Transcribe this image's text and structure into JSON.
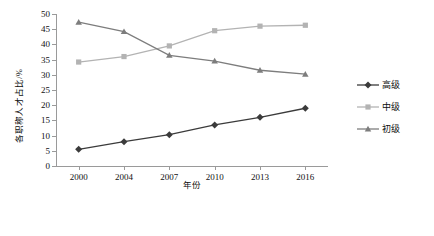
{
  "chart_data": {
    "type": "line",
    "title": "",
    "xlabel": "年份",
    "ylabel": "各职称人才占比/%",
    "categories": [
      "2000",
      "2004",
      "2007",
      "2010",
      "2013",
      "2016"
    ],
    "ylim": [
      0,
      50
    ],
    "ytick_values": [
      0,
      5,
      10,
      15,
      20,
      25,
      30,
      35,
      40,
      45,
      50
    ],
    "ytick_labels": [
      "0",
      "5",
      "10",
      "15",
      "20",
      "25",
      "30",
      "35",
      "40",
      "45",
      "50"
    ],
    "grid": false,
    "legend_position": "right",
    "series": [
      {
        "name": "高级",
        "values": [
          5.5,
          8.0,
          10.3,
          13.5,
          16.0,
          19.0
        ],
        "color": "#3b3b3b",
        "marker": "diamond"
      },
      {
        "name": "中级",
        "values": [
          34.2,
          36.0,
          39.5,
          44.5,
          46.0,
          46.3
        ],
        "color": "#b3b3b3",
        "marker": "square"
      },
      {
        "name": "初级",
        "values": [
          47.3,
          44.2,
          36.4,
          34.5,
          31.5,
          30.2
        ],
        "color": "#7d7d7d",
        "marker": "triangle"
      }
    ]
  },
  "legend": {
    "items": [
      {
        "label": "高级"
      },
      {
        "label": "中级"
      },
      {
        "label": "初级"
      }
    ]
  },
  "axes": {
    "x_title": "年份",
    "y_title": "各职称人才占比/%"
  }
}
